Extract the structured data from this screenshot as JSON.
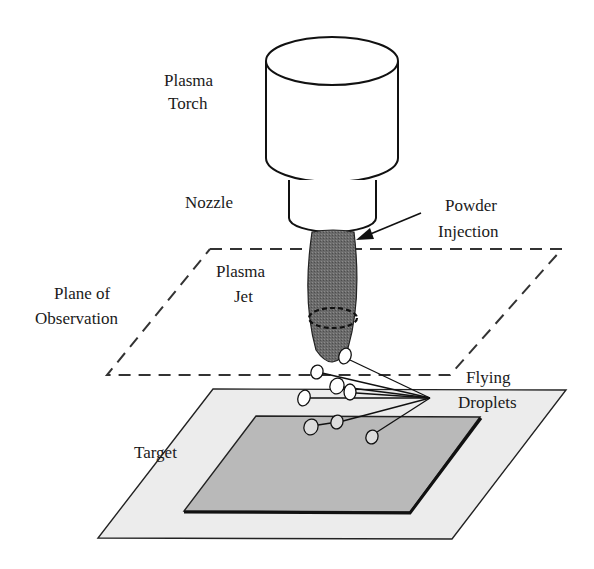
{
  "diagram": {
    "labels": {
      "torch": [
        "Plasma",
        "Torch"
      ],
      "nozzle": "Nozzle",
      "powder_injection": [
        "Powder",
        "Injection"
      ],
      "plane_of_observation": [
        "Plane of",
        "Observation"
      ],
      "plasma_jet": [
        "Plasma",
        "Jet"
      ],
      "flying_droplets": [
        "Flying",
        "Droplets"
      ],
      "target": "Target"
    },
    "colors": {
      "stroke": "#111111",
      "jet_fill": "#6e6e6e",
      "outer_plane_fill": "#ececec",
      "inner_plane_fill": "#b8b8b8",
      "background": "#ffffff"
    }
  }
}
